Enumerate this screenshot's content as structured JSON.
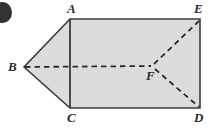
{
  "figure": {
    "type": "geometry-diagram",
    "background_color": "#ffffff",
    "fill_color": "#dcdcdc",
    "outline_color": "#3c3c3c",
    "dash_color": "#2b2b2b",
    "bullet_color": "#333333",
    "labels": {
      "a": "A",
      "b": "B",
      "c": "C",
      "d": "D",
      "e": "E",
      "f": "F"
    },
    "vertices": {
      "a": {
        "x": 70,
        "y": 19
      },
      "b": {
        "x": 24,
        "y": 67
      },
      "c": {
        "x": 70,
        "y": 108
      },
      "d": {
        "x": 200,
        "y": 108
      },
      "e": {
        "x": 200,
        "y": 19
      },
      "f": {
        "x": 153,
        "y": 66
      }
    },
    "solid_edges": [
      "A-E",
      "E-D",
      "D-C",
      "C-B",
      "B-A",
      "A-C"
    ],
    "dashed_edges": [
      "B-F",
      "F-E",
      "F-D"
    ]
  }
}
